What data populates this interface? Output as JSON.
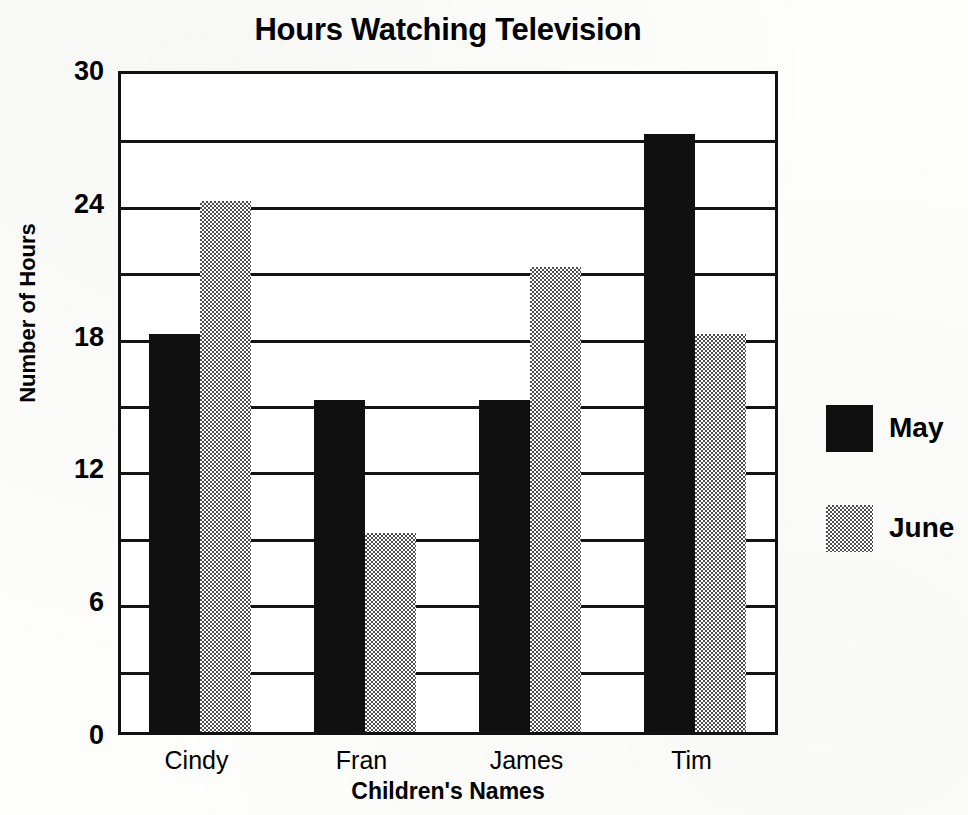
{
  "chart_data": {
    "type": "bar",
    "title": "Hours Watching Television",
    "xlabel": "Children's Names",
    "ylabel": "Number of Hours",
    "categories": [
      "Cindy",
      "Fran",
      "James",
      "Tim"
    ],
    "series": [
      {
        "name": "May",
        "values": [
          18,
          15,
          15,
          27
        ],
        "color": "#101010",
        "fill": "solid-black"
      },
      {
        "name": "June",
        "values": [
          24,
          9,
          21,
          18
        ],
        "color": "#808080",
        "fill": "gray-stipple"
      }
    ],
    "ylim": [
      0,
      30
    ],
    "yticks": [
      0,
      6,
      12,
      18,
      24,
      30
    ],
    "ytick_labels": [
      "0",
      "6",
      "12",
      "18",
      "24",
      "30"
    ],
    "gridline_values": [
      3,
      6,
      9,
      12,
      15,
      18,
      21,
      24,
      27,
      30
    ],
    "grid": true,
    "grid_axis": "horizontal",
    "legend_position": "right",
    "legend_entries": [
      "May",
      "June"
    ],
    "frame": true
  },
  "legend": {
    "items": [
      {
        "label": "May",
        "swatch": "solid-black"
      },
      {
        "label": "June",
        "swatch": "gray-stipple"
      }
    ]
  }
}
